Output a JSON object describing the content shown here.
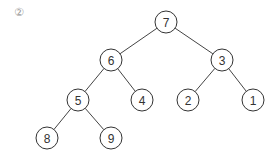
{
  "label": "②",
  "tree": {
    "nodes": [
      {
        "id": "7",
        "value": "7",
        "x": 166,
        "y": 22
      },
      {
        "id": "6",
        "value": "6",
        "x": 111,
        "y": 60
      },
      {
        "id": "3",
        "value": "3",
        "x": 222,
        "y": 60
      },
      {
        "id": "5",
        "value": "5",
        "x": 78,
        "y": 100
      },
      {
        "id": "4",
        "value": "4",
        "x": 142,
        "y": 100
      },
      {
        "id": "2",
        "value": "2",
        "x": 188,
        "y": 100
      },
      {
        "id": "1",
        "value": "1",
        "x": 253,
        "y": 100
      },
      {
        "id": "8",
        "value": "8",
        "x": 47,
        "y": 138
      },
      {
        "id": "9",
        "value": "9",
        "x": 111,
        "y": 138
      }
    ],
    "edges": [
      [
        "7",
        "6"
      ],
      [
        "7",
        "3"
      ],
      [
        "6",
        "5"
      ],
      [
        "6",
        "4"
      ],
      [
        "3",
        "2"
      ],
      [
        "3",
        "1"
      ],
      [
        "5",
        "8"
      ],
      [
        "5",
        "9"
      ]
    ],
    "radius": 11
  }
}
